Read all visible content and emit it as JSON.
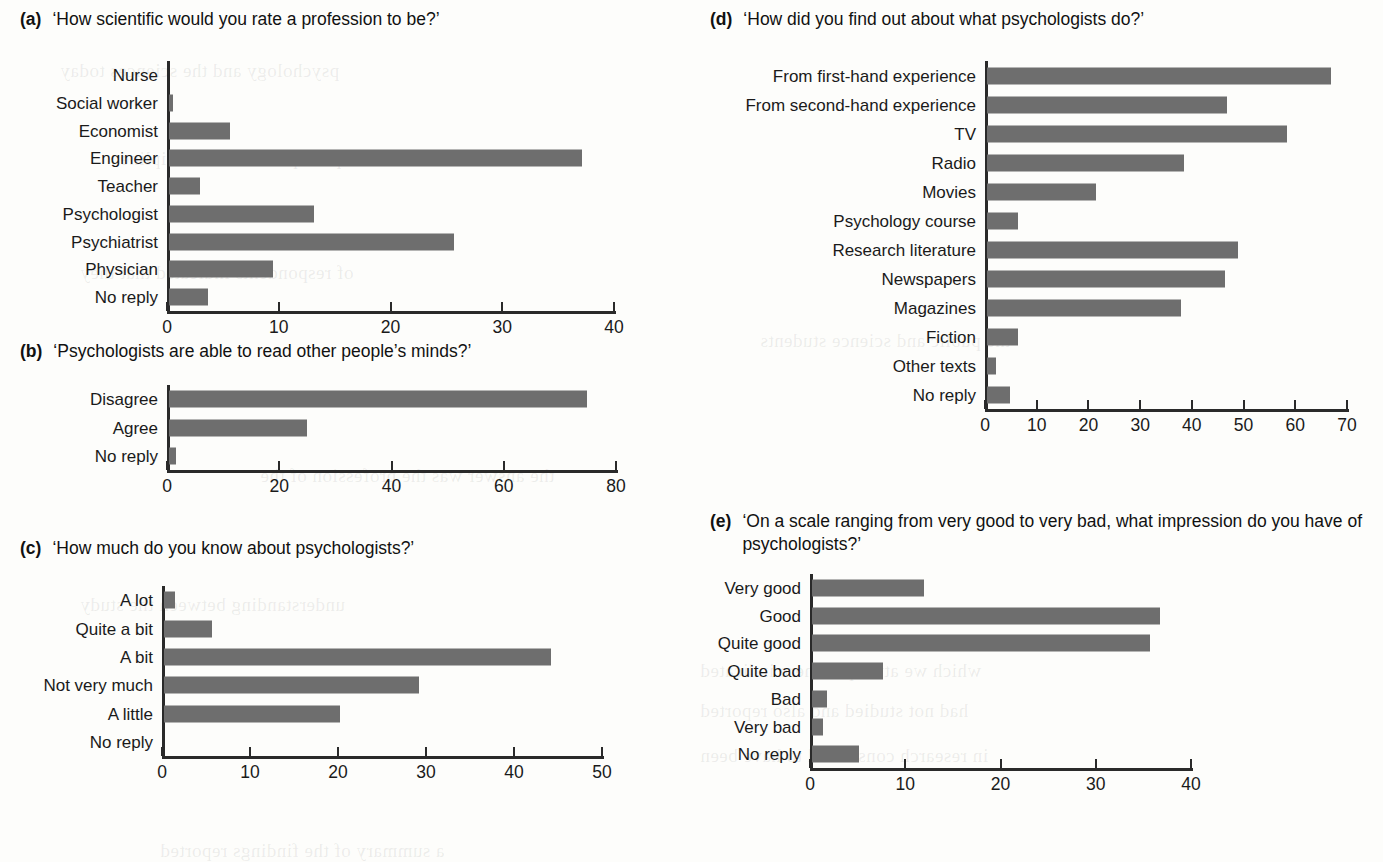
{
  "figure": {
    "background": "#fdfdfb",
    "bar_color": "#6e6e6e",
    "axis_color": "#2a2a2a"
  },
  "panels": {
    "a": {
      "letter": "(a)",
      "question": "‘How scientific would you rate a profession to be?’"
    },
    "b": {
      "letter": "(b)",
      "question": "‘Psychologists are able to read other people’s minds?’"
    },
    "c": {
      "letter": "(c)",
      "question": "‘How much do you know about psychologists?’"
    },
    "d": {
      "letter": "(d)",
      "question": "‘How did you find out about what psychologists do?’"
    },
    "e": {
      "letter": "(e)",
      "question": "‘On a scale ranging from very good to very bad, what impression do you have of psychologists?’"
    }
  },
  "chart_data": [
    {
      "id": "a",
      "type": "bar",
      "orientation": "horizontal",
      "title": "‘How scientific would you rate a profession to be?’",
      "categories": [
        "Nurse",
        "Social worker",
        "Economist",
        "Engineer",
        "Teacher",
        "Psychologist",
        "Psychiatrist",
        "Physician",
        "No reply"
      ],
      "values": [
        0,
        0.4,
        5.5,
        37,
        2.8,
        13,
        25.5,
        9.3,
        3.5
      ],
      "xlabel": "",
      "ylabel": "",
      "xlim": [
        0,
        40
      ],
      "xticks": [
        0,
        10,
        20,
        30,
        40
      ],
      "xticklabels": [
        "0",
        "10",
        "20",
        "30",
        "40"
      ],
      "grid": false,
      "legend": false
    },
    {
      "id": "b",
      "type": "bar",
      "orientation": "horizontal",
      "title": "‘Psychologists are able to read other people’s minds?’",
      "categories": [
        "Disagree",
        "Agree",
        "No reply"
      ],
      "values": [
        74.5,
        24.5,
        1.2
      ],
      "xlabel": "",
      "ylabel": "",
      "xlim": [
        0,
        80
      ],
      "xticks": [
        0,
        20,
        40,
        60,
        80
      ],
      "xticklabels": [
        "0",
        "20",
        "40",
        "60",
        "80"
      ],
      "grid": false,
      "legend": false
    },
    {
      "id": "c",
      "type": "bar",
      "orientation": "horizontal",
      "title": "‘How much do you know about psychologists?’",
      "categories": [
        "A lot",
        "Quite a bit",
        "A bit",
        "Not very much",
        "A little",
        "No reply"
      ],
      "values": [
        1.2,
        5.5,
        44,
        29,
        20,
        0
      ],
      "xlabel": "",
      "ylabel": "",
      "xlim": [
        0,
        50
      ],
      "xticks": [
        0,
        10,
        20,
        30,
        40,
        50
      ],
      "xticklabels": [
        "0",
        "10",
        "20",
        "30",
        "40",
        "50"
      ],
      "grid": false,
      "legend": false
    },
    {
      "id": "d",
      "type": "bar",
      "orientation": "horizontal",
      "title": "‘How did you find out about what psychologists do?’",
      "categories": [
        "From first-hand experience",
        "From second-hand experience",
        "TV",
        "Radio",
        "Movies",
        "Psychology course",
        "Research literature",
        "Newspapers",
        "Magazines",
        "Fiction",
        "Other texts",
        "No reply"
      ],
      "values": [
        66.5,
        46.5,
        58,
        38,
        21,
        6,
        48.5,
        46,
        37.5,
        6,
        1.8,
        4.5
      ],
      "xlabel": "",
      "ylabel": "",
      "xlim": [
        0,
        70
      ],
      "xticks": [
        0,
        10,
        20,
        30,
        40,
        50,
        60,
        70
      ],
      "xticklabels": [
        "0",
        "10",
        "20",
        "30",
        "40",
        "50",
        "60",
        "70"
      ],
      "grid": false,
      "legend": false
    },
    {
      "id": "e",
      "type": "bar",
      "orientation": "horizontal",
      "title": "‘On a scale ranging from very good to very bad, what impression do you have of psychologists?’",
      "categories": [
        "Very good",
        "Good",
        "Quite good",
        "Quite bad",
        "Bad",
        "Very bad",
        "No reply"
      ],
      "values": [
        11.8,
        36.5,
        35.5,
        7.5,
        1.6,
        1.2,
        4.9
      ],
      "xlabel": "",
      "ylabel": "",
      "xlim": [
        0,
        40
      ],
      "xticks": [
        0,
        10,
        20,
        30,
        40
      ],
      "xticklabels": [
        "0",
        "10",
        "20",
        "30",
        "40"
      ],
      "grid": false,
      "legend": false
    }
  ]
}
